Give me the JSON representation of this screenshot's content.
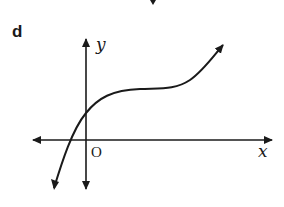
{
  "figure": {
    "part_label": "d",
    "axes": {
      "x_label": "x",
      "y_label": "y",
      "origin_label": "O"
    },
    "curve": {
      "description": "cubic-like curve increasing, crossing x-axis left of origin, y-intercept positive, with a horizontal point of inflection in first quadrant, arrows at both ends",
      "color": "#1a1a1a"
    },
    "top_fragment": "arrow tip from previous figure"
  }
}
